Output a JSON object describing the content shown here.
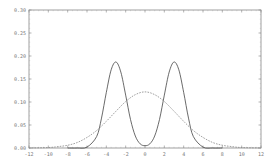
{
  "chart_data": {
    "type": "line",
    "title": "",
    "xlabel": "",
    "ylabel": "",
    "xlim": [
      -12,
      12
    ],
    "ylim": [
      0,
      0.3
    ],
    "grid": false,
    "legend": null,
    "x_ticks": [
      "-12",
      "-10",
      "-8",
      "-6",
      "-4",
      "-2",
      "0",
      "2",
      "4",
      "6",
      "8",
      "10",
      "12"
    ],
    "y_ticks": [
      "0.00",
      "0.05",
      "0.10",
      "0.15",
      "0.20",
      "0.25",
      "0.30"
    ],
    "series": [
      {
        "name": "bimodal (solid)",
        "style": "solid",
        "x": [
          -8,
          -7,
          -6,
          -5,
          -4.5,
          -4,
          -3.5,
          -3,
          -2.5,
          -2,
          -1.5,
          -1,
          -0.5,
          0,
          0.5,
          1,
          1.5,
          2,
          2.5,
          3,
          3.5,
          4,
          4.5,
          5,
          6,
          7,
          8
        ],
        "values": [
          0.0,
          0.0,
          0.002,
          0.025,
          0.065,
          0.121,
          0.17,
          0.187,
          0.165,
          0.115,
          0.062,
          0.026,
          0.009,
          0.005,
          0.009,
          0.026,
          0.062,
          0.115,
          0.165,
          0.187,
          0.17,
          0.121,
          0.065,
          0.025,
          0.002,
          0.0,
          0.0
        ]
      },
      {
        "name": "normal (dashed)",
        "style": "dashed",
        "x": [
          -12,
          -10,
          -9,
          -8,
          -7,
          -6,
          -5,
          -4,
          -3,
          -2,
          -1,
          0,
          1,
          2,
          3,
          4,
          5,
          6,
          7,
          8,
          9,
          10,
          12
        ],
        "values": [
          0.0001,
          0.001,
          0.003,
          0.006,
          0.012,
          0.023,
          0.038,
          0.058,
          0.08,
          0.101,
          0.116,
          0.122,
          0.116,
          0.101,
          0.08,
          0.058,
          0.038,
          0.023,
          0.012,
          0.006,
          0.003,
          0.001,
          0.0001
        ]
      }
    ]
  }
}
